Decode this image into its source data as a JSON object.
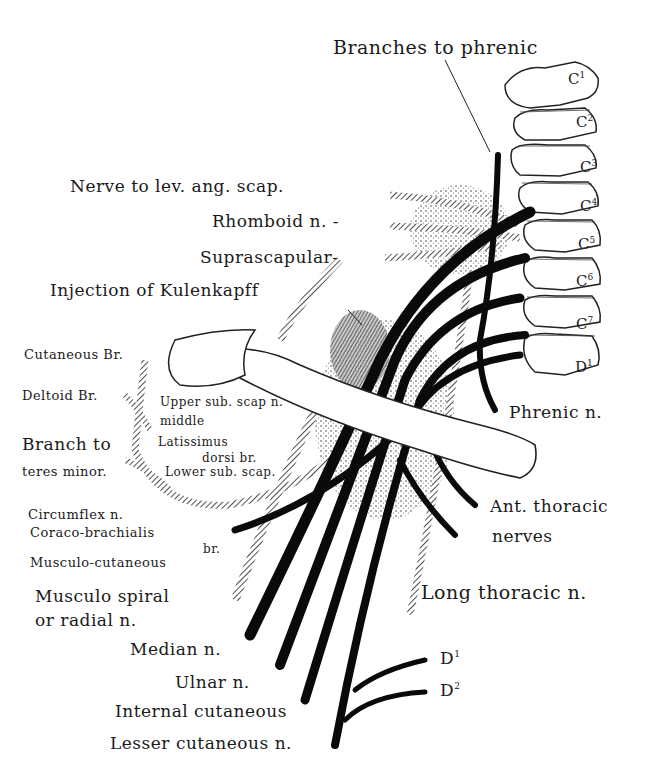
{
  "figure": {
    "colors": {
      "nerve": "#0a0a0a",
      "bone": "#ffffff",
      "ink": "#1a1a1a",
      "stipple": "#555555"
    }
  },
  "labels": {
    "branches_to_phrenic": "Branches to phrenic",
    "nerve_to_lev_ang_scap": "Nerve to  lev. ang. scap.",
    "rhomboid": "Rhomboid n. -",
    "suprascapular": "Suprascapular-",
    "injection_kulenkapff": "Injection of Kulenkapff",
    "cutaneous_br": "Cutaneous Br.",
    "deltoid_br": "Deltoid Br.",
    "branch_to": "Branch to",
    "teres_minor": "teres minor.",
    "upper_sub_scap": "Upper sub. scap n.",
    "middle": "middle",
    "latissimus": "Latissimus",
    "dorsi_br": "dorsi br.",
    "lower_sub_scap": "Lower sub. scap.",
    "circumflex": "Circumflex n.",
    "coraco_brachialis": "Coraco-brachialis",
    "br": "br.",
    "musculo_cutaneous": "Musculo-cutaneous",
    "musculo_spiral": "Musculo  spiral",
    "or_radial": "or  radial  n.",
    "median": "Median  n.",
    "ulnar": "Ulnar  n.",
    "internal_cutaneous": "Internal cutaneous",
    "lesser_cutaneous": "Lesser  cutaneous n.",
    "phrenic_n": "Phrenic n.",
    "ant_thoracic": "Ant.  thoracic",
    "nerves": "nerves",
    "long_thoracic": "Long  thoracic n.",
    "d1_root": "D",
    "d2_root": "D"
  },
  "vertebrae": [
    {
      "label": "C",
      "sup": "1"
    },
    {
      "label": "C",
      "sup": "2"
    },
    {
      "label": "C",
      "sup": "3"
    },
    {
      "label": "C",
      "sup": "4"
    },
    {
      "label": "C",
      "sup": "5"
    },
    {
      "label": "C",
      "sup": "6"
    },
    {
      "label": "C",
      "sup": "7"
    },
    {
      "label": "D",
      "sup": "1"
    }
  ],
  "intercostal": [
    {
      "label": "D",
      "sup": "1"
    },
    {
      "label": "D",
      "sup": "2"
    }
  ]
}
